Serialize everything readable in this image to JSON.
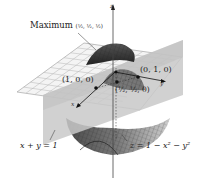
{
  "figure": {
    "axes": {
      "x": "x",
      "y": "y",
      "z": "z"
    },
    "labels": {
      "maximum": "Maximum",
      "maximum_point": "(½, ½, ½)",
      "point_x": "(1, 0, 0)",
      "point_y": "(0, 1, 0)",
      "point_mid": "(½, ½, 0)",
      "plane_equation": "x + y = 1",
      "surface_equation": "z = 1 − x² − y²"
    },
    "colors": {
      "surface_dark": "#3a3a3a",
      "surface_mid": "#8a8a8a",
      "plane": "#c8c8c8",
      "grid": "#e8e8e8",
      "grid_line": "#9a9a9a",
      "axis": "#333333"
    }
  }
}
